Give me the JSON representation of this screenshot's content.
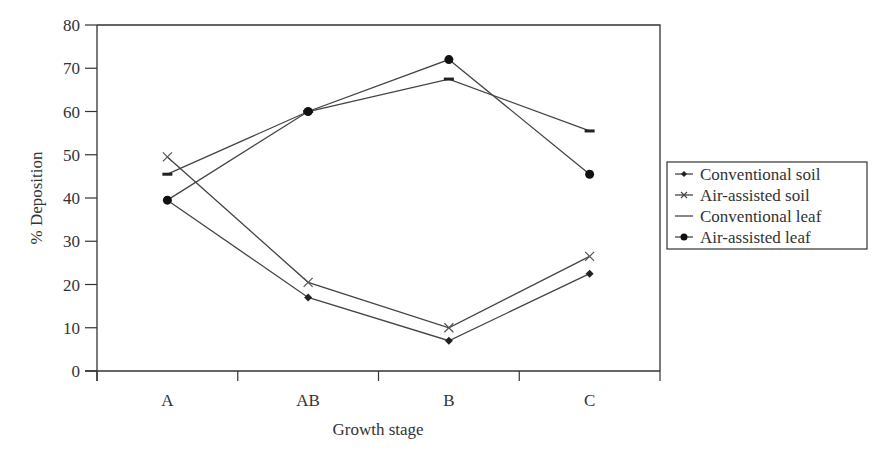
{
  "chart_data": {
    "type": "line",
    "title": "",
    "xlabel": "Growth stage",
    "ylabel": "% Deposition",
    "categories": [
      "A",
      "AB",
      "B",
      "C"
    ],
    "ylim": [
      0,
      80
    ],
    "yticks": [
      0,
      10,
      20,
      30,
      40,
      50,
      60,
      70,
      80
    ],
    "grid": false,
    "legend_position": "right",
    "series": [
      {
        "name": "Conventional soil",
        "marker": "diamond",
        "values": [
          39.5,
          17,
          7,
          22.5
        ]
      },
      {
        "name": "Air-assisted soil",
        "marker": "x",
        "values": [
          49.5,
          20.5,
          10,
          26.5
        ]
      },
      {
        "name": "Conventional leaf",
        "marker": "dash",
        "values": [
          45.5,
          60,
          67.5,
          55.5
        ]
      },
      {
        "name": "Air-assisted leaf",
        "marker": "circle",
        "values": [
          39.5,
          60,
          72,
          45.5
        ]
      }
    ]
  },
  "colors": {
    "line": "#444444",
    "axis": "#333333",
    "text": "#333333"
  }
}
